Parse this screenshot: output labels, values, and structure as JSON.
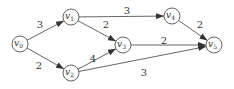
{
  "graph": {
    "nodes": [
      {
        "id": "v0",
        "label": "v",
        "sub": "0",
        "x": 20,
        "y": 44
      },
      {
        "id": "v1",
        "label": "v",
        "sub": "1",
        "x": 71,
        "y": 17
      },
      {
        "id": "v2",
        "label": "v",
        "sub": "2",
        "x": 71,
        "y": 73
      },
      {
        "id": "v3",
        "label": "v",
        "sub": "3",
        "x": 123,
        "y": 45
      },
      {
        "id": "v4",
        "label": "v",
        "sub": "4",
        "x": 172,
        "y": 16
      },
      {
        "id": "v5",
        "label": "v",
        "sub": "5",
        "x": 214,
        "y": 45
      }
    ],
    "edges": [
      {
        "from": "v0",
        "to": "v1",
        "weight": "3",
        "lx": 40,
        "ly": 28
      },
      {
        "from": "v0",
        "to": "v2",
        "weight": "2",
        "lx": 39,
        "ly": 69
      },
      {
        "from": "v1",
        "to": "v3",
        "weight": "2",
        "lx": 106,
        "ly": 28
      },
      {
        "from": "v1",
        "to": "v4",
        "weight": "3",
        "lx": 127,
        "ly": 14
      },
      {
        "from": "v2",
        "to": "v3",
        "weight": "4",
        "lx": 93,
        "ly": 62
      },
      {
        "from": "v2",
        "to": "v5",
        "weight": "3",
        "lx": 144,
        "ly": 76
      },
      {
        "from": "v3",
        "to": "v5",
        "weight": "2",
        "lx": 164,
        "ly": 44
      },
      {
        "from": "v4",
        "to": "v5",
        "weight": "2",
        "lx": 200,
        "ly": 28
      }
    ]
  }
}
